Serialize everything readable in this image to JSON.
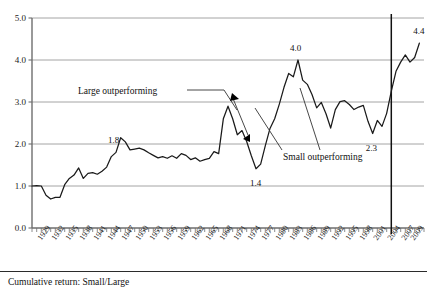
{
  "caption": "Cumulative return: Small/Large",
  "annotations": {
    "large": "Large outperforming",
    "small": "Small outperforming"
  },
  "colors": {
    "line": "#1a1a1a",
    "grid": "#9a9a9a",
    "axis": "#6e6e6e",
    "marker": "#000000",
    "background": "#ffffff"
  },
  "chart_data": {
    "type": "line",
    "title": "",
    "subtitle": "",
    "xlabel": "",
    "ylabel": "",
    "grid": true,
    "legend": "none",
    "ylim": [
      0.0,
      5.0
    ],
    "yticks": [
      "0.0",
      "1.0",
      "2.0",
      "3.0",
      "4.0",
      "5.0"
    ],
    "ytick_values": [
      0.0,
      1.0,
      2.0,
      3.0,
      4.0,
      5.0
    ],
    "xlim": [
      1926,
      2010
    ],
    "xticks": [
      "1929",
      "1932",
      "1935",
      "1938",
      "1941",
      "1944",
      "1947",
      "1950",
      "1953",
      "1956",
      "1959",
      "1962",
      "1965",
      "1968",
      "1971",
      "1974",
      "1977",
      "1980",
      "1983",
      "1986",
      "1989",
      "1992",
      "1995",
      "1998",
      "2001",
      "2004",
      "2007",
      "2009"
    ],
    "xtick_values": [
      1929,
      1932,
      1935,
      1938,
      1941,
      1944,
      1947,
      1950,
      1953,
      1956,
      1959,
      1962,
      1965,
      1968,
      1971,
      1974,
      1977,
      1980,
      1983,
      1986,
      1989,
      1992,
      1995,
      1998,
      2001,
      2004,
      2007,
      2009
    ],
    "series": [
      {
        "name": "Cumulative return: Small/Large",
        "x": [
          1926,
          1927,
          1928,
          1929,
          1930,
          1931,
          1932,
          1933,
          1934,
          1935,
          1936,
          1937,
          1938,
          1939,
          1940,
          1941,
          1942,
          1943,
          1944,
          1945,
          1946,
          1947,
          1948,
          1949,
          1950,
          1951,
          1952,
          1953,
          1954,
          1955,
          1956,
          1957,
          1958,
          1959,
          1960,
          1961,
          1962,
          1963,
          1964,
          1965,
          1966,
          1967,
          1968,
          1969,
          1970,
          1971,
          1972,
          1973,
          1974,
          1975,
          1976,
          1977,
          1978,
          1979,
          1980,
          1981,
          1982,
          1983,
          1984,
          1985,
          1986,
          1987,
          1988,
          1989,
          1990,
          1991,
          1992,
          1993,
          1994,
          1995,
          1996,
          1997,
          1998,
          1999,
          2000,
          2001,
          2002,
          2003,
          2004,
          2005,
          2006,
          2007,
          2008,
          2009
        ],
        "y": [
          1.0,
          1.01,
          1.0,
          0.78,
          0.69,
          0.73,
          0.73,
          1.03,
          1.18,
          1.26,
          1.43,
          1.18,
          1.3,
          1.32,
          1.28,
          1.35,
          1.45,
          1.7,
          1.8,
          2.15,
          2.05,
          1.86,
          1.88,
          1.9,
          1.86,
          1.79,
          1.73,
          1.67,
          1.7,
          1.66,
          1.72,
          1.66,
          1.77,
          1.73,
          1.63,
          1.67,
          1.59,
          1.63,
          1.66,
          1.82,
          1.77,
          2.6,
          2.9,
          2.6,
          2.22,
          2.32,
          2.06,
          1.72,
          1.41,
          1.52,
          1.96,
          2.37,
          2.6,
          2.95,
          3.35,
          3.68,
          3.6,
          4.0,
          3.52,
          3.42,
          3.18,
          2.86,
          2.99,
          2.72,
          2.38,
          2.82,
          3.01,
          3.03,
          2.94,
          2.82,
          2.88,
          2.92,
          2.54,
          2.25,
          2.56,
          2.42,
          2.73,
          3.26,
          3.73,
          3.95,
          4.12,
          3.95,
          4.06,
          4.4
        ]
      }
    ],
    "point_labels": [
      {
        "label": "1.8",
        "x": 1944,
        "y": 1.8
      },
      {
        "label": "1.4",
        "x": 1974,
        "y": 1.41
      },
      {
        "label": "4.0",
        "x": 1983,
        "y": 4.0
      },
      {
        "label": "2.3",
        "x": 1999,
        "y": 2.25
      },
      {
        "label": "4.4",
        "x": 2009,
        "y": 4.4
      }
    ],
    "vertical_marker": {
      "x": 2003,
      "label": ""
    }
  }
}
